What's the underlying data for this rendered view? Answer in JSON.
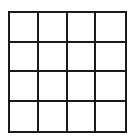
{
  "grid": {
    "rows": 4,
    "cols": 4,
    "line_color": "#1a1a1a",
    "background": "#ffffff",
    "cells": [
      [
        "",
        "",
        "",
        ""
      ],
      [
        "",
        "",
        "",
        ""
      ],
      [
        "",
        "",
        "",
        ""
      ],
      [
        "",
        "",
        "",
        ""
      ]
    ]
  }
}
